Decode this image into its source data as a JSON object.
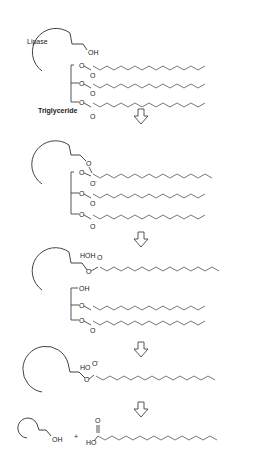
{
  "labels": {
    "enzyme": "Lipase",
    "substrate": "Triglyceride",
    "oh": "OH",
    "o": "O",
    "o_minus": "O",
    "o_minus_charge": "-",
    "hoh": "HOH",
    "ho": "HO",
    "plus": "+"
  },
  "colors": {
    "line": "#444444",
    "background": "#ffffff"
  },
  "steps": [
    {
      "id": 1,
      "description": "Lipase (with serine OH) approaches triglyceride with three fatty acyl ester chains"
    },
    {
      "id": 2,
      "description": "Tetrahedral intermediate: enzyme O attacks carbonyl of first ester, O- formed"
    },
    {
      "id": 3,
      "description": "Acyl-enzyme intermediate with water (HOH); glycerol released as diglyceride with OH"
    },
    {
      "id": 4,
      "description": "Second tetrahedral intermediate with HO and O-"
    },
    {
      "id": 5,
      "description": "Free lipase (OH) + free fatty acid (HO-C(=O)-chain)"
    }
  ],
  "arrows": [
    {
      "icon": "down-arrow-icon",
      "y": 113
    },
    {
      "icon": "down-arrow-icon",
      "y": 205
    },
    {
      "icon": "down-arrow-icon",
      "y": 317
    },
    {
      "icon": "down-arrow-icon",
      "y": 395
    }
  ]
}
